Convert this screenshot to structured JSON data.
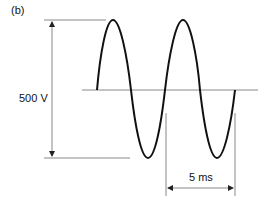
{
  "figure": {
    "panel_label": "(b)",
    "amplitude_label": "500 V",
    "period_label": "5 ms"
  },
  "colors": {
    "waveform": "#111111",
    "guide_lines": "#888888"
  }
}
